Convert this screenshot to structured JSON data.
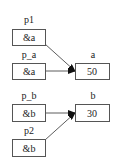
{
  "diagram": {
    "nodes": [
      {
        "id": "p1",
        "label": "p1",
        "value": "&a"
      },
      {
        "id": "p_a",
        "label": "p_a",
        "value": "&a"
      },
      {
        "id": "a",
        "label": "a",
        "value": "50"
      },
      {
        "id": "p_b",
        "label": "p_b",
        "value": "&b"
      },
      {
        "id": "b",
        "label": "b",
        "value": "30"
      },
      {
        "id": "p2",
        "label": "p2",
        "value": "&b"
      }
    ],
    "edges": [
      {
        "from": "p1",
        "to": "a"
      },
      {
        "from": "p_a",
        "to": "a"
      },
      {
        "from": "p_b",
        "to": "b"
      },
      {
        "from": "p2",
        "to": "b"
      }
    ]
  }
}
